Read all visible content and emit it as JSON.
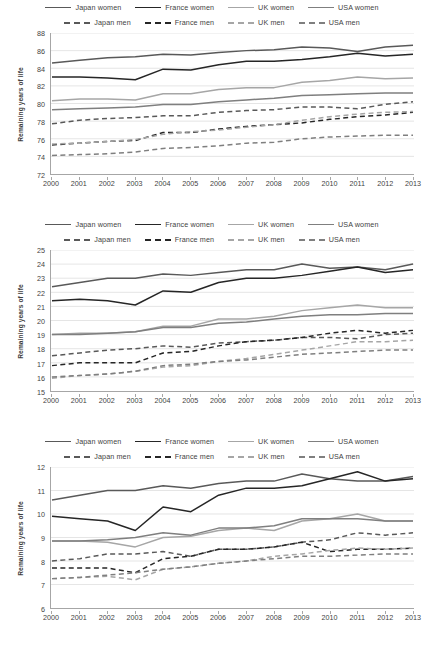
{
  "legend": {
    "rows": [
      [
        {
          "label": "Japan women",
          "color": "#595959",
          "style": "solid"
        },
        {
          "label": "France women",
          "color": "#262626",
          "style": "solid"
        },
        {
          "label": "UK women",
          "color": "#a6a6a6",
          "style": "solid"
        },
        {
          "label": "USA women",
          "color": "#7f7f7f",
          "style": "solid"
        }
      ],
      [
        {
          "label": "Japan men",
          "color": "#595959",
          "style": "dashed"
        },
        {
          "label": "France men",
          "color": "#262626",
          "style": "dashed"
        },
        {
          "label": "UK men",
          "color": "#a6a6a6",
          "style": "dashed"
        },
        {
          "label": "USA men",
          "color": "#7f7f7f",
          "style": "dashed"
        }
      ]
    ]
  },
  "axis_title": "Remaining years of life",
  "years": [
    2000,
    2001,
    2002,
    2003,
    2004,
    2005,
    2006,
    2007,
    2008,
    2009,
    2010,
    2011,
    2012,
    2013
  ],
  "chart_data": [
    {
      "type": "line",
      "title": "",
      "xlabel": "",
      "ylabel": "Remaining years of life",
      "x": [
        2000,
        2001,
        2002,
        2003,
        2004,
        2005,
        2006,
        2007,
        2008,
        2009,
        2010,
        2011,
        2012,
        2013
      ],
      "xlim": [
        2000,
        2013
      ],
      "ylim": [
        72,
        88
      ],
      "yticks": [
        72,
        74,
        76,
        78,
        80,
        82,
        84,
        86,
        88
      ],
      "grid": true,
      "legend_position": "top",
      "series": [
        {
          "name": "Japan women",
          "color": "#595959",
          "style": "solid",
          "values": [
            84.6,
            84.9,
            85.2,
            85.3,
            85.6,
            85.5,
            85.8,
            86.0,
            86.1,
            86.4,
            86.3,
            85.9,
            86.4,
            86.6
          ]
        },
        {
          "name": "France women",
          "color": "#262626",
          "style": "solid",
          "values": [
            83.0,
            83.0,
            82.9,
            82.7,
            83.9,
            83.8,
            84.4,
            84.8,
            84.8,
            85.0,
            85.3,
            85.7,
            85.4,
            85.6
          ]
        },
        {
          "name": "UK women",
          "color": "#a6a6a6",
          "style": "solid",
          "values": [
            80.3,
            80.5,
            80.5,
            80.4,
            81.1,
            81.1,
            81.6,
            81.8,
            81.8,
            82.4,
            82.6,
            83.0,
            82.8,
            82.9
          ]
        },
        {
          "name": "USA women",
          "color": "#7f7f7f",
          "style": "solid",
          "values": [
            79.3,
            79.4,
            79.5,
            79.6,
            79.9,
            79.9,
            80.2,
            80.4,
            80.6,
            80.9,
            81.0,
            81.1,
            81.2,
            81.2
          ]
        },
        {
          "name": "Japan men",
          "color": "#595959",
          "style": "dashed",
          "values": [
            77.7,
            78.1,
            78.3,
            78.4,
            78.6,
            78.6,
            79.0,
            79.2,
            79.3,
            79.6,
            79.6,
            79.4,
            79.9,
            80.2
          ]
        },
        {
          "name": "France men",
          "color": "#262626",
          "style": "dashed",
          "values": [
            75.3,
            75.5,
            75.7,
            75.8,
            76.7,
            76.7,
            77.1,
            77.4,
            77.6,
            77.8,
            78.2,
            78.5,
            78.7,
            79.0
          ]
        },
        {
          "name": "UK men",
          "color": "#a6a6a6",
          "style": "dashed",
          "values": [
            75.4,
            75.5,
            75.7,
            75.9,
            76.5,
            76.8,
            77.0,
            77.3,
            77.6,
            78.1,
            78.5,
            78.8,
            79.0,
            79.1
          ]
        },
        {
          "name": "USA men",
          "color": "#7f7f7f",
          "style": "dashed",
          "values": [
            74.1,
            74.2,
            74.3,
            74.5,
            74.9,
            75.0,
            75.2,
            75.5,
            75.6,
            76.0,
            76.2,
            76.3,
            76.4,
            76.4
          ]
        }
      ]
    },
    {
      "type": "line",
      "title": "",
      "xlabel": "",
      "ylabel": "Remaining years of life",
      "x": [
        2000,
        2001,
        2002,
        2003,
        2004,
        2005,
        2006,
        2007,
        2008,
        2009,
        2010,
        2011,
        2012,
        2013
      ],
      "xlim": [
        2000,
        2013
      ],
      "ylim": [
        15,
        25
      ],
      "yticks": [
        15,
        16,
        17,
        18,
        19,
        20,
        21,
        22,
        23,
        24,
        25
      ],
      "grid": true,
      "legend_position": "top",
      "series": [
        {
          "name": "Japan women",
          "color": "#595959",
          "style": "solid",
          "values": [
            22.4,
            22.7,
            23.0,
            23.0,
            23.3,
            23.2,
            23.4,
            23.6,
            23.6,
            24.0,
            23.7,
            23.8,
            23.6,
            24.0
          ]
        },
        {
          "name": "France women",
          "color": "#262626",
          "style": "solid",
          "values": [
            21.4,
            21.5,
            21.4,
            21.1,
            22.1,
            22.0,
            22.7,
            23.0,
            23.0,
            23.2,
            23.5,
            23.8,
            23.4,
            23.6
          ]
        },
        {
          "name": "UK women",
          "color": "#a6a6a6",
          "style": "solid",
          "values": [
            19.0,
            19.1,
            19.1,
            19.2,
            19.6,
            19.6,
            20.1,
            20.1,
            20.3,
            20.7,
            20.9,
            21.1,
            20.9,
            20.9
          ]
        },
        {
          "name": "USA women",
          "color": "#7f7f7f",
          "style": "solid",
          "values": [
            19.0,
            19.0,
            19.1,
            19.2,
            19.5,
            19.5,
            19.8,
            19.9,
            20.1,
            20.3,
            20.4,
            20.4,
            20.5,
            20.5
          ]
        },
        {
          "name": "Japan men",
          "color": "#595959",
          "style": "dashed",
          "values": [
            17.5,
            17.7,
            17.9,
            18.0,
            18.2,
            18.1,
            18.4,
            18.5,
            18.6,
            18.8,
            18.8,
            18.7,
            19.0,
            19.1
          ]
        },
        {
          "name": "France men",
          "color": "#262626",
          "style": "dashed",
          "values": [
            16.8,
            17.0,
            17.0,
            17.0,
            17.7,
            17.8,
            18.2,
            18.5,
            18.6,
            18.8,
            19.1,
            19.3,
            19.1,
            19.3
          ]
        },
        {
          "name": "UK men",
          "color": "#a6a6a6",
          "style": "dashed",
          "values": [
            15.9,
            16.1,
            16.2,
            16.4,
            16.7,
            16.8,
            17.1,
            17.3,
            17.6,
            17.9,
            18.2,
            18.5,
            18.5,
            18.6
          ]
        },
        {
          "name": "USA men",
          "color": "#7f7f7f",
          "style": "dashed",
          "values": [
            16.0,
            16.1,
            16.2,
            16.4,
            16.8,
            16.9,
            17.1,
            17.2,
            17.4,
            17.6,
            17.7,
            17.8,
            17.9,
            17.9
          ]
        }
      ]
    },
    {
      "type": "line",
      "title": "",
      "xlabel": "",
      "ylabel": "Remaining years of life",
      "x": [
        2000,
        2001,
        2002,
        2003,
        2004,
        2005,
        2006,
        2007,
        2008,
        2009,
        2010,
        2011,
        2012,
        2013
      ],
      "xlim": [
        2000,
        2013
      ],
      "ylim": [
        6,
        12
      ],
      "yticks": [
        6,
        7,
        8,
        9,
        10,
        11,
        12
      ],
      "grid": true,
      "legend_position": "top",
      "series": [
        {
          "name": "Japan women",
          "color": "#595959",
          "style": "solid",
          "values": [
            10.6,
            10.8,
            11.0,
            11.0,
            11.2,
            11.1,
            11.3,
            11.4,
            11.4,
            11.7,
            11.5,
            11.4,
            11.4,
            11.6
          ]
        },
        {
          "name": "France women",
          "color": "#262626",
          "style": "solid",
          "values": [
            9.9,
            9.8,
            9.7,
            9.3,
            10.3,
            10.1,
            10.8,
            11.1,
            11.1,
            11.2,
            11.5,
            11.8,
            11.4,
            11.5
          ]
        },
        {
          "name": "UK women",
          "color": "#a6a6a6",
          "style": "solid",
          "values": [
            8.85,
            8.85,
            8.8,
            8.6,
            9.0,
            9.05,
            9.3,
            9.4,
            9.3,
            9.7,
            9.8,
            10.0,
            9.7,
            9.7
          ]
        },
        {
          "name": "USA women",
          "color": "#7f7f7f",
          "style": "solid",
          "values": [
            8.85,
            8.85,
            8.9,
            9.0,
            9.2,
            9.1,
            9.4,
            9.4,
            9.5,
            9.8,
            9.8,
            9.8,
            9.7,
            9.7
          ]
        },
        {
          "name": "Japan men",
          "color": "#595959",
          "style": "dashed",
          "values": [
            8.0,
            8.1,
            8.3,
            8.3,
            8.4,
            8.2,
            8.5,
            8.5,
            8.6,
            8.8,
            8.9,
            9.2,
            9.1,
            9.2
          ]
        },
        {
          "name": "France men",
          "color": "#262626",
          "style": "dashed",
          "values": [
            7.7,
            7.7,
            7.7,
            7.5,
            8.1,
            8.2,
            8.5,
            8.5,
            8.6,
            8.8,
            8.4,
            8.5,
            8.5,
            8.55
          ]
        },
        {
          "name": "UK men",
          "color": "#a6a6a6",
          "style": "dashed",
          "values": [
            7.25,
            7.3,
            7.35,
            7.2,
            7.65,
            7.75,
            7.9,
            8.0,
            8.2,
            8.3,
            8.45,
            8.55,
            8.5,
            8.55
          ]
        },
        {
          "name": "USA men",
          "color": "#7f7f7f",
          "style": "dashed",
          "values": [
            7.25,
            7.3,
            7.4,
            7.5,
            7.65,
            7.75,
            7.9,
            8.0,
            8.1,
            8.2,
            8.2,
            8.25,
            8.3,
            8.3
          ]
        }
      ]
    }
  ]
}
